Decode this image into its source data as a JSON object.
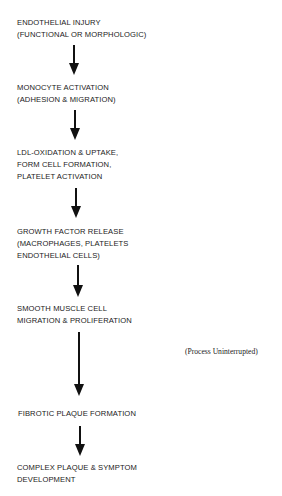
{
  "diagram": {
    "steps": [
      {
        "lines": [
          "ENDOTHELIAL INJURY",
          "(FUNCTIONAL OR MORPHOLOGIC)"
        ]
      },
      {
        "lines": [
          "MONOCYTE ACTIVATION",
          "(ADHESION & MIGRATION)"
        ]
      },
      {
        "lines": [
          "LDL-OXIDATION & UPTAKE,",
          "FORM CELL FORMATION,",
          "PLATELET ACTIVATION"
        ]
      },
      {
        "lines": [
          "GROWTH FACTOR RELEASE",
          "(MACROPHAGES, PLATELETS",
          "ENDOTHELIAL CELLS)"
        ]
      },
      {
        "lines": [
          "SMOOTH MUSCLE CELL",
          "MIGRATION & PROLIFERATION"
        ]
      },
      {
        "lines": [
          "FIBROTIC PLAQUE FORMATION"
        ]
      },
      {
        "lines": [
          "COMPLEX PLAQUE & SYMPTOM",
          "DEVELOPMENT"
        ]
      }
    ],
    "side_note": "(Process Uninterrupted)",
    "arrow_color": "#111111"
  }
}
